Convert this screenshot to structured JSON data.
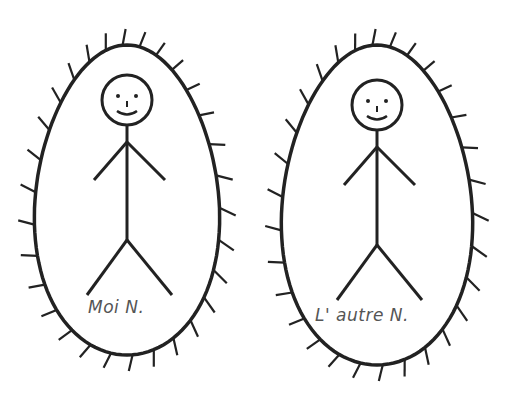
{
  "figures": [
    {
      "id": "me",
      "label": "Moi N.",
      "center_x": 127,
      "center_y": 200,
      "rx": 92,
      "ry": 155
    },
    {
      "id": "other",
      "label": "L'   autre N.",
      "center_x": 377,
      "center_y": 205,
      "rx": 95,
      "ry": 160
    }
  ],
  "colors": {
    "stroke": "#222222",
    "text": "#555555",
    "background": "#ffffff"
  }
}
